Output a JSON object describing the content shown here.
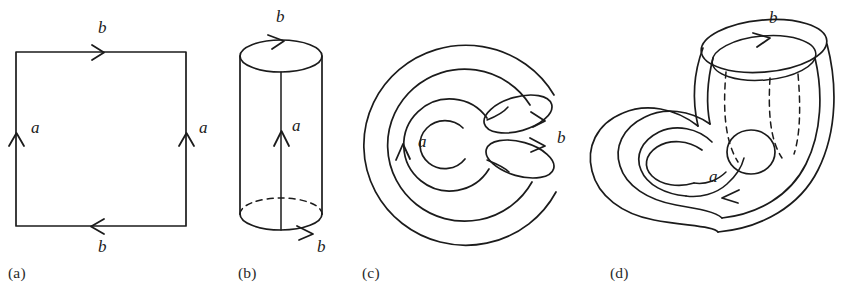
{
  "figure": {
    "background_color": "#ffffff",
    "ink_color": "#1b1b1b",
    "panel_count": 4
  },
  "panels": [
    {
      "id": "a",
      "label": "(a)",
      "caption_x": 8,
      "caption_y": 264,
      "description": "Square fundamental polygon with edge word identifications",
      "shape": "square",
      "edge_labels": [
        {
          "name": "b",
          "text": "b",
          "x": 98,
          "y": 33,
          "edge": "top",
          "direction": "right"
        },
        {
          "name": "a-left",
          "text": "a",
          "x": 31,
          "y": 133,
          "edge": "left",
          "direction": "up"
        },
        {
          "name": "a-right",
          "text": "a",
          "x": 199,
          "y": 133,
          "edge": "right",
          "direction": "up"
        },
        {
          "name": "b-bottom",
          "text": "b",
          "x": 98,
          "y": 252,
          "edge": "bottom",
          "direction": "left"
        }
      ]
    },
    {
      "id": "b",
      "label": "(b)",
      "caption_x": 238,
      "caption_y": 264,
      "description": "Cylinder formed by gluing the two a edges of the square",
      "shape": "cylinder",
      "edge_labels": [
        {
          "name": "b-top",
          "text": "b",
          "x": 276,
          "y": 22,
          "edge": "top-rim",
          "direction": "right"
        },
        {
          "name": "a-seam",
          "text": "a",
          "x": 292,
          "y": 131,
          "edge": "seam",
          "direction": "up"
        },
        {
          "name": "b-bottom",
          "text": "b",
          "x": 317,
          "y": 252,
          "edge": "bottom-rim",
          "direction": "right"
        }
      ]
    },
    {
      "id": "c",
      "label": "(c)",
      "caption_x": 362,
      "caption_y": 264,
      "description": "Cylinder bent into a C shape so the two b circles face each other",
      "shape": "bent-tube",
      "edge_labels": [
        {
          "name": "a-left",
          "text": "a",
          "x": 418,
          "y": 147,
          "edge": "side",
          "direction": "up"
        },
        {
          "name": "b-ends",
          "text": "b",
          "x": 557,
          "y": 143,
          "edge": "openings",
          "direction": "right"
        }
      ]
    },
    {
      "id": "d",
      "label": "(d)",
      "caption_x": 610,
      "caption_y": 264,
      "description": "Completed Klein bottle: the tube passes through its own wall and the b circles are glued with reversed orientation",
      "shape": "klein-bottle",
      "edge_labels": [
        {
          "name": "b-rim",
          "text": "b",
          "x": 769,
          "y": 23,
          "edge": "top-rim",
          "direction": "right"
        },
        {
          "name": "a-body",
          "text": "a",
          "x": 709,
          "y": 182,
          "edge": "body",
          "direction": "left"
        }
      ]
    }
  ],
  "icons": {
    "arrow": "arrowhead-chevron"
  }
}
